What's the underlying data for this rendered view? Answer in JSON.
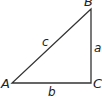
{
  "diagram": {
    "type": "right-triangle",
    "vertices": [
      {
        "id": "A",
        "label": "A"
      },
      {
        "id": "B",
        "label": "B"
      },
      {
        "id": "C",
        "label": "C"
      }
    ],
    "sides": [
      {
        "id": "a",
        "label": "a",
        "between": [
          "B",
          "C"
        ]
      },
      {
        "id": "b",
        "label": "b",
        "between": [
          "A",
          "C"
        ]
      },
      {
        "id": "c",
        "label": "c",
        "between": [
          "A",
          "B"
        ]
      }
    ],
    "right_angle_at": "C",
    "stroke_color": "#333333"
  }
}
